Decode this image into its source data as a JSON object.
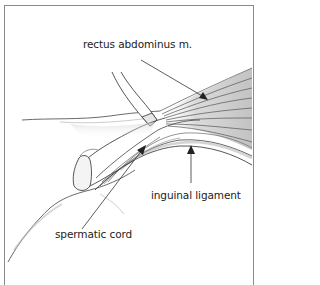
{
  "figure": {
    "labels": [
      {
        "id": "rectus",
        "text": "rectus abdominus m.",
        "x": 83,
        "y": 44
      },
      {
        "id": "inguinal",
        "text": "inguinal ligament",
        "x": 151,
        "y": 197
      },
      {
        "id": "spermatic",
        "text": "spermatic cord",
        "x": 55,
        "y": 235
      }
    ],
    "colors": {
      "border": "#8a8a8a",
      "line": "#333333",
      "shade": "#9a9a9a",
      "background": "#ffffff"
    }
  }
}
